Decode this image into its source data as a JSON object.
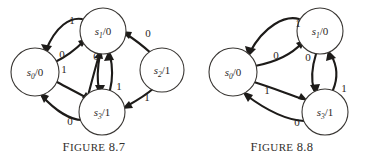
{
  "page": {
    "background": "#ffffff",
    "ink": "#1d1b19",
    "node_stroke": "#3a3734",
    "text_color": "#2b2724"
  },
  "figures": [
    {
      "id": "figure-87",
      "caption": "Figure 8.7",
      "caption_prefix": "F",
      "caption_rest": "IGURE",
      "caption_number": "8.7",
      "diagram_type": "state-transition-diagram",
      "states": [
        {
          "name": "s0/0",
          "state": "s",
          "sub": "0",
          "sep": "/",
          "output": "0",
          "cx": 35,
          "cy": 72,
          "r": 24
        },
        {
          "name": "s1/0",
          "state": "s",
          "sub": "1",
          "sep": "/",
          "output": "0",
          "cx": 103,
          "cy": 31,
          "r": 23
        },
        {
          "name": "s2/1",
          "state": "s",
          "sub": "2",
          "sep": "/",
          "output": "1",
          "cx": 162,
          "cy": 70,
          "r": 22
        },
        {
          "name": "s3/1",
          "state": "s",
          "sub": "3",
          "sep": "/",
          "output": "1",
          "cx": 102,
          "cy": 112,
          "r": 23
        }
      ],
      "transitions": [
        {
          "from": "s1/0",
          "to": "s0/0",
          "input": "1",
          "label_x": 72,
          "label_y": 24
        },
        {
          "from": "s0/0",
          "to": "s1/0",
          "input": "0",
          "label_x": 62,
          "label_y": 55
        },
        {
          "from": "s3/1",
          "to": "s1/0",
          "input": "0",
          "label_x": 96,
          "label_y": 57
        },
        {
          "from": "s0/0",
          "to": "s3/1",
          "input": "1",
          "label_x": 64,
          "label_y": 70
        },
        {
          "from": "s1/0",
          "to": "s3/1",
          "input": "1",
          "label_x": 119,
          "label_y": 87
        },
        {
          "from": "s3/1",
          "to": "s0/0",
          "input": "0",
          "label_x": 70,
          "label_y": 122
        },
        {
          "from": "s2/1",
          "to": "s1/0",
          "input": "0",
          "label_x": 148,
          "label_y": 34
        },
        {
          "from": "s2/1",
          "to": "s3/1",
          "input": "1",
          "label_x": 147,
          "label_y": 98
        }
      ]
    },
    {
      "id": "figure-88",
      "caption": "Figure 8.8",
      "caption_prefix": "F",
      "caption_rest": "IGURE",
      "caption_number": "8.8",
      "diagram_type": "state-transition-diagram",
      "states": [
        {
          "name": "s0/0",
          "state": "s",
          "sub": "0",
          "sep": "/",
          "output": "0",
          "cx": 45,
          "cy": 72,
          "r": 24
        },
        {
          "name": "s1/0",
          "state": "s",
          "sub": "1",
          "sep": "/",
          "output": "0",
          "cx": 132,
          "cy": 31,
          "r": 23
        },
        {
          "name": "s3/1",
          "state": "s",
          "sub": "3",
          "sep": "/",
          "output": "1",
          "cx": 137,
          "cy": 112,
          "r": 23
        }
      ],
      "transitions": [
        {
          "from": "s1/0",
          "to": "s0/0",
          "input": "1",
          "label_x": 110,
          "label_y": 24
        },
        {
          "from": "s0/0",
          "to": "s1/0",
          "input": "0",
          "label_x": 88,
          "label_y": 56
        },
        {
          "from": "s1/0",
          "to": "s3/1",
          "input": "0",
          "label_x": 120,
          "label_y": 58
        },
        {
          "from": "s0/0",
          "to": "s3/1",
          "input": "1",
          "label_x": 79,
          "label_y": 91
        },
        {
          "from": "s3/1",
          "to": "s1/0",
          "input": "1",
          "label_x": 155,
          "label_y": 89
        },
        {
          "from": "s3/1",
          "to": "s0/0",
          "input": "0",
          "label_x": 109,
          "label_y": 123
        }
      ]
    }
  ]
}
